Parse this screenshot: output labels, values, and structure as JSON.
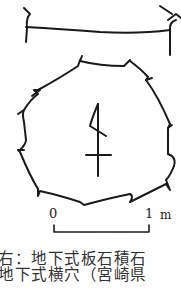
{
  "figure": {
    "type": "archaeological plan drawing",
    "scale_bar": {
      "start_label": "0",
      "end_label": "1",
      "unit": "m"
    },
    "caption_lines": [
      "右：地下式板石積石",
      "地下式横穴（宮崎県"
    ]
  }
}
